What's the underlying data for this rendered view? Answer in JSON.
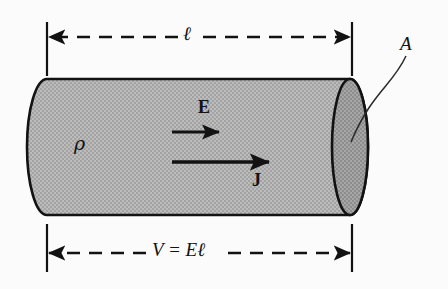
{
  "figure": {
    "width": 448,
    "height": 289,
    "background_color": "#fbfbfb",
    "line_color": "#121212"
  },
  "conductor": {
    "body_fill": "#b0b0b0",
    "end_face_fill": "#9a9a9a",
    "outline_color": "#121212",
    "outline_width": 2.6,
    "left_x": 27,
    "right_x": 350,
    "top_y": 79,
    "bottom_y": 215,
    "end_ellipse_rx": 18,
    "end_ellipse_ry": 68
  },
  "labels": {
    "length": "ℓ",
    "area": "A",
    "resistivity": "ρ",
    "electric_field": "E",
    "current_density": "J",
    "voltage_relation": "V = Eℓ"
  },
  "dimensions": {
    "top": {
      "label": "ℓ",
      "y": 37,
      "x_start": 47,
      "x_end": 352,
      "style": "dashed-double-arrow"
    },
    "bottom": {
      "label": "V = Eℓ",
      "y": 253,
      "x_start": 47,
      "x_end": 352,
      "style": "dashed-double-arrow"
    },
    "extension_lines": [
      {
        "x": 47,
        "y_top": 22,
        "y_bottom": 76
      },
      {
        "x": 352,
        "y_top": 22,
        "y_bottom": 76
      },
      {
        "x": 47,
        "y_top": 224,
        "y_bottom": 272
      },
      {
        "x": 352,
        "y_top": 224,
        "y_bottom": 272
      }
    ]
  },
  "vectors": [
    {
      "name": "electric-field",
      "label": "E",
      "y": 132,
      "x_start": 172,
      "x_end": 219,
      "label_position": "above",
      "shaft_width": 3.0
    },
    {
      "name": "current-density",
      "label": "J",
      "y": 162,
      "x_start": 172,
      "x_end": 269,
      "label_position": "below",
      "shaft_width": 3.4
    }
  ],
  "leader": {
    "label": "A",
    "from_x": 406,
    "from_y": 56,
    "to_x": 351,
    "to_y": 142,
    "description": "curved leader from A label to right end face"
  }
}
